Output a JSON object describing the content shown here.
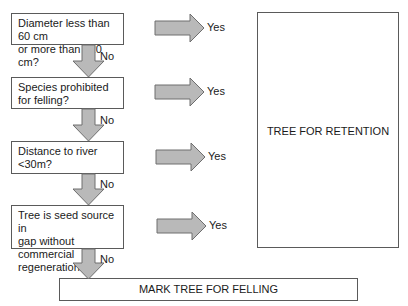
{
  "diagram": {
    "questions": [
      {
        "text": "Diameter less than 60 cm\nor more than 120 cm?",
        "yes": "Yes",
        "no": "No"
      },
      {
        "text": "Species prohibited\nfor felling?",
        "yes": "Yes",
        "no": "No"
      },
      {
        "text": "Distance to river\n<30m?",
        "yes": "Yes",
        "no": "No"
      },
      {
        "text": "Tree is seed source in\ngap without commercial\nregeneration?",
        "yes": "Yes",
        "no": "No"
      }
    ],
    "retention_label": "TREE FOR RETENTION",
    "felling_label": "MARK TREE FOR FELLING",
    "colors": {
      "arrow_fill": "#b9b9b9",
      "arrow_stroke": "#6e6e6e",
      "box_border": "#5a5a5a"
    }
  }
}
